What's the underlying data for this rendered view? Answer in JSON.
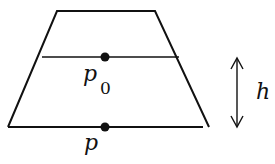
{
  "diagram": {
    "colors": {
      "stroke": "#111111",
      "background": "#ffffff"
    },
    "shape": {
      "type": "trapezoid",
      "top_left": [
        57,
        11
      ],
      "top_right": [
        155,
        11
      ],
      "bottom_right": [
        209,
        127
      ],
      "bottom_left": [
        8,
        127
      ]
    },
    "lines": [
      {
        "name": "reference-level-line",
        "from": [
          42,
          57
        ],
        "to": [
          179,
          57
        ]
      }
    ],
    "points": [
      {
        "name": "point-p0",
        "label": "p",
        "subscript": "0",
        "at": [
          105,
          57
        ]
      },
      {
        "name": "point-p",
        "label": "p",
        "subscript": "",
        "at": [
          105,
          127
        ]
      }
    ],
    "dimension": {
      "name": "depth-arrow",
      "label": "h",
      "x": 237,
      "from_y": 58,
      "to_y": 127
    }
  }
}
